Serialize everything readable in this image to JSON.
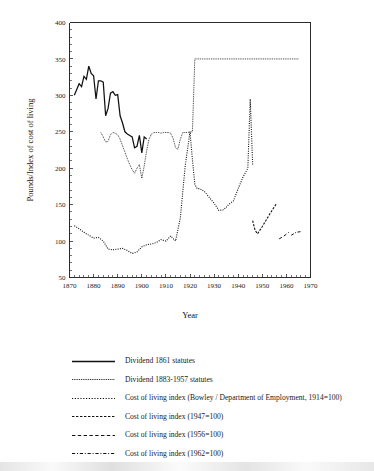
{
  "chart_data": {
    "type": "line",
    "title": "",
    "xlabel": "Year",
    "ylabel": "Pounds/Index of cost of living",
    "xlim": [
      1870,
      1970
    ],
    "ylim": [
      50,
      400
    ],
    "xticks": [
      1870,
      1880,
      1890,
      1900,
      1910,
      1920,
      1930,
      1940,
      1950,
      1960,
      1970
    ],
    "yticks": [
      50,
      100,
      150,
      200,
      250,
      300,
      350,
      400
    ],
    "grid": false,
    "legend_position": "below-plot",
    "series": [
      {
        "name": "Dividend 1861 statutes",
        "style": "solid",
        "x": [
          1872,
          1873,
          1874,
          1875,
          1876,
          1877,
          1878,
          1879,
          1880,
          1881,
          1882,
          1883,
          1884,
          1885,
          1886,
          1887,
          1888,
          1889,
          1890,
          1891,
          1892,
          1893,
          1894,
          1895,
          1896,
          1897,
          1898,
          1899,
          1900,
          1901,
          1902
        ],
        "y": [
          300,
          308,
          316,
          312,
          326,
          322,
          340,
          330,
          327,
          295,
          320,
          320,
          318,
          272,
          282,
          303,
          305,
          300,
          301,
          272,
          262,
          250,
          247,
          245,
          243,
          228,
          230,
          245,
          221,
          243,
          240
        ]
      },
      {
        "name": "Dividend 1883-1957 statutes",
        "style": "fine-dotted",
        "x": [
          1883,
          1884,
          1885,
          1886,
          1887,
          1888,
          1889,
          1890,
          1891,
          1892,
          1893,
          1894,
          1895,
          1896,
          1897,
          1898,
          1899,
          1900,
          1901,
          1902,
          1903,
          1904,
          1905,
          1906,
          1907,
          1908,
          1909,
          1910,
          1911,
          1912,
          1913,
          1914,
          1915,
          1916,
          1917,
          1918,
          1919,
          1920,
          1921,
          1922,
          1923,
          1924,
          1925,
          1926,
          1930,
          1935,
          1940,
          1945,
          1950,
          1955,
          1960,
          1965
        ],
        "y": [
          249,
          243,
          236,
          237,
          246,
          249,
          248,
          246,
          240,
          231,
          222,
          213,
          205,
          198,
          193,
          200,
          205,
          186,
          203,
          224,
          240,
          247,
          249,
          249,
          249,
          248,
          249,
          249,
          249,
          248,
          241,
          228,
          226,
          240,
          249,
          249,
          249,
          250,
          250,
          350,
          350,
          350,
          350,
          350,
          350,
          350,
          350,
          350,
          350,
          350,
          350,
          350
        ]
      },
      {
        "name": "Cost of living index (Bowley / Department of Employment, 1914=100)",
        "style": "dotted",
        "x": [
          1872,
          1874,
          1876,
          1878,
          1880,
          1882,
          1884,
          1886,
          1888,
          1890,
          1892,
          1894,
          1896,
          1898,
          1900,
          1902,
          1904,
          1906,
          1908,
          1910,
          1912,
          1914,
          1916,
          1918,
          1920,
          1921,
          1922,
          1923,
          1924,
          1926,
          1928,
          1930,
          1932,
          1934,
          1936,
          1938,
          1940,
          1942,
          1944,
          1945,
          1946
        ],
        "y": [
          121,
          117,
          112,
          108,
          104,
          105,
          100,
          89,
          88,
          89,
          90,
          87,
          83,
          85,
          92,
          95,
          96,
          98,
          102,
          100,
          107,
          100,
          132,
          203,
          250,
          212,
          178,
          172,
          172,
          168,
          160,
          152,
          142,
          143,
          150,
          155,
          172,
          188,
          200,
          295,
          205
        ]
      },
      {
        "name": "Cost of living index (1947=100)",
        "style": "dashed-med",
        "x": [
          1946,
          1947,
          1948,
          1950,
          1952,
          1954,
          1956
        ],
        "y": [
          128,
          115,
          110,
          120,
          131,
          142,
          152
        ]
      },
      {
        "name": "Cost of living index (1956=100)",
        "style": "dashed-long",
        "x": [
          1957,
          1959,
          1961
        ],
        "y": [
          103,
          107,
          112
        ]
      },
      {
        "name": "Cost of living index (1962=100)",
        "style": "dash-dot",
        "x": [
          1962,
          1964,
          1966
        ],
        "y": [
          108,
          112,
          113
        ]
      }
    ]
  },
  "axes": {
    "y_axis_label": "Pounds/Index of cost of living",
    "x_axis_label": "Year",
    "y_tick_labels": [
      "400",
      "350",
      "300",
      "250",
      "200",
      "150",
      "100",
      "50"
    ],
    "x_tick_labels": [
      "1870",
      "1880",
      "1890",
      "1900",
      "1910",
      "1920",
      "1930",
      "1940",
      "1950",
      "1960",
      "1970"
    ]
  },
  "legend": {
    "entries": [
      {
        "label": "Dividend 1861 statutes",
        "style": "solid"
      },
      {
        "label": "Dividend 1883-1957 statutes",
        "style": "fine-dotted"
      },
      {
        "label": "Cost of living index (Bowley / Department of Employment, 1914=100)",
        "style": "dotted"
      },
      {
        "label": "Cost of living index (1947=100)",
        "style": "dashed-med"
      },
      {
        "label": "Cost of living index (1956=100)",
        "style": "dashed-long"
      },
      {
        "label": "Cost of living index (1962=100)",
        "style": "dash-dot"
      }
    ]
  }
}
